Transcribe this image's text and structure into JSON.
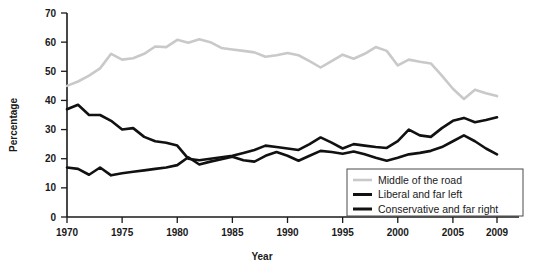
{
  "chart_data": {
    "type": "line",
    "title": "",
    "xlabel": "Year",
    "ylabel": "Percentage",
    "xlim": [
      1970,
      2009
    ],
    "ylim": [
      0,
      70
    ],
    "xticks": [
      1970,
      1975,
      1980,
      1985,
      1990,
      1995,
      2000,
      2005,
      2009
    ],
    "yticks": [
      0,
      10,
      20,
      30,
      40,
      50,
      60,
      70
    ],
    "grid": false,
    "legend_position": "bottom-right",
    "x": [
      1970,
      1971,
      1972,
      1973,
      1974,
      1975,
      1976,
      1977,
      1978,
      1979,
      1980,
      1981,
      1982,
      1983,
      1984,
      1985,
      1986,
      1987,
      1988,
      1989,
      1990,
      1991,
      1992,
      1993,
      1994,
      1995,
      1996,
      1997,
      1998,
      1999,
      2000,
      2001,
      2002,
      2003,
      2004,
      2005,
      2006,
      2007,
      2008,
      2009
    ],
    "series": [
      {
        "name": "Middle of the road",
        "color": "#c9c9c9",
        "width": 2.6,
        "values": [
          45.0,
          46.5,
          48.5,
          51.0,
          56.0,
          54.0,
          54.5,
          56.0,
          58.5,
          58.3,
          60.8,
          59.8,
          61.0,
          60.0,
          58.0,
          57.5,
          57.0,
          56.5,
          55.0,
          55.5,
          56.3,
          55.5,
          53.5,
          51.3,
          53.5,
          55.7,
          54.3,
          56.0,
          58.3,
          57.0,
          52.0,
          54.0,
          53.3,
          52.7,
          48.5,
          44.0,
          40.5,
          43.7,
          42.5,
          41.5
        ]
      },
      {
        "name": "Liberal and far left",
        "color": "#111111",
        "width": 2.6,
        "values": [
          37.0,
          38.5,
          35.0,
          35.0,
          33.0,
          30.0,
          30.5,
          27.5,
          26.0,
          25.5,
          24.5,
          20.0,
          19.5,
          20.0,
          20.5,
          21.0,
          22.0,
          23.0,
          24.5,
          24.0,
          23.5,
          23.0,
          25.0,
          27.3,
          25.5,
          23.5,
          25.0,
          24.5,
          24.0,
          23.7,
          26.0,
          30.0,
          28.0,
          27.5,
          30.5,
          33.0,
          34.0,
          32.5,
          33.3,
          34.2
        ]
      },
      {
        "name": "Conservative and far right",
        "color": "#111111",
        "width": 2.6,
        "values": [
          17.0,
          16.5,
          14.5,
          17.0,
          14.3,
          15.0,
          15.5,
          16.0,
          16.5,
          17.0,
          17.8,
          20.5,
          18.0,
          19.0,
          19.8,
          20.7,
          19.5,
          19.0,
          21.0,
          22.3,
          21.0,
          19.3,
          21.0,
          22.7,
          22.3,
          21.7,
          22.5,
          21.5,
          20.3,
          19.3,
          20.3,
          21.5,
          22.0,
          22.7,
          24.0,
          26.0,
          28.0,
          26.0,
          23.5,
          21.5
        ]
      }
    ]
  },
  "legend": {
    "items": [
      {
        "label": "Middle of the road",
        "color": "#c9c9c9"
      },
      {
        "label": "Liberal and far left",
        "color": "#111111"
      },
      {
        "label": "Conservative and far right",
        "color": "#111111"
      }
    ]
  },
  "axes": {
    "ylabel": "Percentage",
    "xlabel": "Year",
    "ytick_labels": [
      "70",
      "60",
      "50",
      "40",
      "30",
      "20",
      "10",
      "0"
    ],
    "xtick_labels": [
      "1970",
      "1975",
      "1980",
      "1985",
      "1990",
      "1995",
      "2000",
      "2005",
      "2009"
    ]
  }
}
